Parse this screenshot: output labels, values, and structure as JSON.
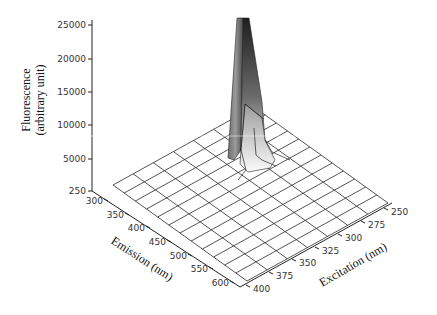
{
  "chart_data": {
    "type": "surface3d",
    "title": "",
    "zlabel": "Fluorescence (arbitrary unit)",
    "zlabel_lines": [
      "Fluorescence",
      "(arbitrary unit)"
    ],
    "xlabel": "Emission (nm)",
    "ylabel": "Excitation (nm)",
    "z_ticks": [
      "250",
      "5000",
      "10000",
      "15000",
      "20000",
      "25000"
    ],
    "emission_ticks": [
      "300",
      "350",
      "400",
      "450",
      "500",
      "550",
      "600"
    ],
    "excitation_ticks": [
      "250",
      "275",
      "300",
      "325",
      "350",
      "375",
      "400"
    ],
    "z_range": [
      250,
      25000
    ],
    "emission_range": [
      300,
      600
    ],
    "excitation_range": [
      250,
      400
    ],
    "grid": true,
    "peak": {
      "emission_nm": 300,
      "excitation_nm": 280,
      "fluorescence": 25000,
      "note": "sharp peak exceeding axis top near low emission / low excitation corner"
    },
    "baseline_fluorescence": 250,
    "colors": {
      "peak_dark": "#2b2b2b",
      "peak_mid": "#8a8a8a",
      "peak_light": "#f2f2f2",
      "grid": "#2a2a2a",
      "axis": "#222222"
    }
  }
}
